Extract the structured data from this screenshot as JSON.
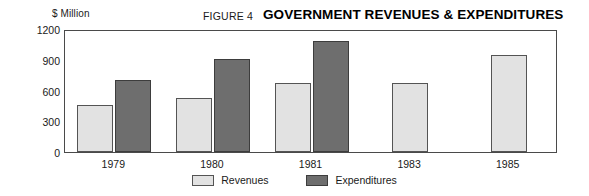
{
  "header": {
    "figure_number": "FIGURE 4",
    "title": "GOVERNMENT REVENUES & EXPENDITURES",
    "unit_label": "$ Million"
  },
  "legend": {
    "items": [
      {
        "label": "Revenues",
        "color": "#e2e2e2"
      },
      {
        "label": "Expenditures",
        "color": "#6e6e6e"
      }
    ]
  },
  "chart_data": {
    "type": "bar",
    "title": "GOVERNMENT REVENUES & EXPENDITURES",
    "xlabel": "",
    "ylabel": "$ Million",
    "categories": [
      "1979",
      "1980",
      "1981",
      "1983",
      "1985"
    ],
    "ylim": [
      0,
      1200
    ],
    "yticks": [
      0,
      300,
      600,
      900,
      1200
    ],
    "ytick_labels": [
      "0",
      "300",
      "600",
      "900",
      "1200"
    ],
    "grid": false,
    "legend_position": "bottom-center",
    "series": [
      {
        "name": "Revenues",
        "color": "#e2e2e2",
        "values": [
          460,
          530,
          670,
          670,
          950
        ]
      },
      {
        "name": "Expenditures",
        "color": "#6e6e6e",
        "values": [
          700,
          910,
          1080,
          null,
          null
        ]
      }
    ]
  }
}
